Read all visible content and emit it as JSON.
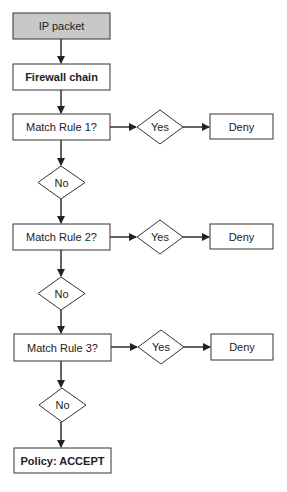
{
  "diagram": {
    "type": "flowchart",
    "colors": {
      "stroke": "#333333",
      "start_fill": "#c8c8c8",
      "box_fill": "#ffffff",
      "text": "#222222"
    },
    "nodes": {
      "ip_packet": {
        "label": "IP packet",
        "shape": "rect",
        "style": "filled"
      },
      "firewall_chain": {
        "label": "Firewall chain",
        "shape": "rect",
        "style": "bold"
      },
      "rule1": {
        "label": "Match Rule 1?",
        "shape": "rect"
      },
      "yes1": {
        "label": "Yes",
        "shape": "diamond"
      },
      "deny1": {
        "label": "Deny",
        "shape": "rect"
      },
      "no1": {
        "label": "No",
        "shape": "diamond"
      },
      "rule2": {
        "label": "Match Rule 2?",
        "shape": "rect"
      },
      "yes2": {
        "label": "Yes",
        "shape": "diamond"
      },
      "deny2": {
        "label": "Deny",
        "shape": "rect"
      },
      "no2": {
        "label": "No",
        "shape": "diamond"
      },
      "rule3": {
        "label": "Match Rule 3?",
        "shape": "rect"
      },
      "yes3": {
        "label": "Yes",
        "shape": "diamond"
      },
      "deny3": {
        "label": "Deny",
        "shape": "rect"
      },
      "no3": {
        "label": "No",
        "shape": "diamond"
      },
      "policy": {
        "label": "Policy: ACCEPT",
        "shape": "rect",
        "style": "bold"
      }
    },
    "edges": [
      [
        "ip_packet",
        "firewall_chain"
      ],
      [
        "firewall_chain",
        "rule1"
      ],
      [
        "rule1",
        "yes1"
      ],
      [
        "yes1",
        "deny1"
      ],
      [
        "rule1",
        "no1"
      ],
      [
        "no1",
        "rule2"
      ],
      [
        "rule2",
        "yes2"
      ],
      [
        "yes2",
        "deny2"
      ],
      [
        "rule2",
        "no2"
      ],
      [
        "no2",
        "rule3"
      ],
      [
        "rule3",
        "yes3"
      ],
      [
        "yes3",
        "deny3"
      ],
      [
        "rule3",
        "no3"
      ],
      [
        "no3",
        "policy"
      ]
    ]
  }
}
